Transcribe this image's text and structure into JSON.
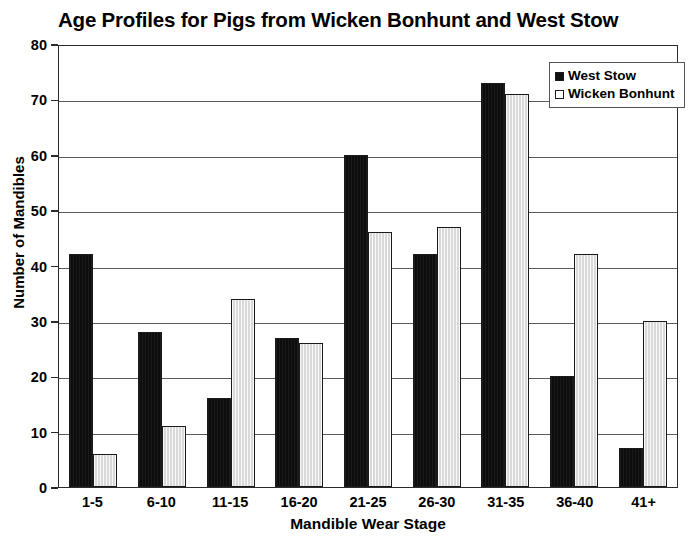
{
  "chart_data": {
    "type": "bar",
    "title": "Age Profiles for Pigs from Wicken Bonhunt and West Stow",
    "xlabel": "Mandible Wear Stage",
    "ylabel": "Number of Mandibles",
    "categories": [
      "1-5",
      "6-10",
      "11-15",
      "16-20",
      "21-25",
      "26-30",
      "31-35",
      "36-40",
      "41+"
    ],
    "series": [
      {
        "name": "West Stow",
        "color": "#111111",
        "values": [
          42,
          28,
          16,
          27,
          60,
          42,
          73,
          20,
          7
        ]
      },
      {
        "name": "Wicken Bonhunt",
        "color": "#d9d9d9",
        "values": [
          6,
          11,
          34,
          26,
          46,
          47,
          71,
          42,
          30
        ]
      }
    ],
    "ylim": [
      0,
      80
    ],
    "yticks": [
      0,
      10,
      20,
      30,
      40,
      50,
      60,
      70,
      80
    ],
    "ytick_labels": [
      "0",
      "10",
      "20",
      "30",
      "40",
      "50",
      "60",
      "70",
      "80"
    ],
    "grid": "horizontal",
    "legend_position": "top-right",
    "bar_mode": "grouped"
  }
}
